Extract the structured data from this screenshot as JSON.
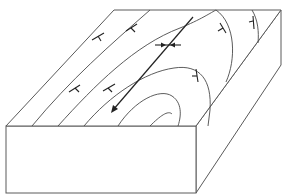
{
  "diagram": {
    "title": "",
    "type": "geological-block-diagram",
    "colors": {
      "line": "#5a5a5a",
      "axis": "#222222",
      "background": "#ffffff"
    },
    "features": {
      "fold_axis": "plunging-axis-arrow",
      "axial_symbol": "converging-arrows",
      "strike_dip_symbol_count": 8,
      "contour_count": 7
    }
  }
}
